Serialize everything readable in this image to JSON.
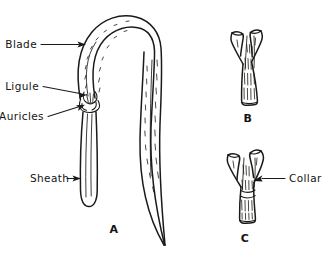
{
  "figure": {
    "background_color": "#ffffff",
    "ink_color": "#1a1a18",
    "labels": {
      "blade": "Blade",
      "ligule": "Ligule",
      "auricles": "Auricles",
      "sheath": "Sheath",
      "collar": "Collar"
    },
    "figure_letters": {
      "a": "A",
      "b": "B",
      "c": "C"
    }
  }
}
